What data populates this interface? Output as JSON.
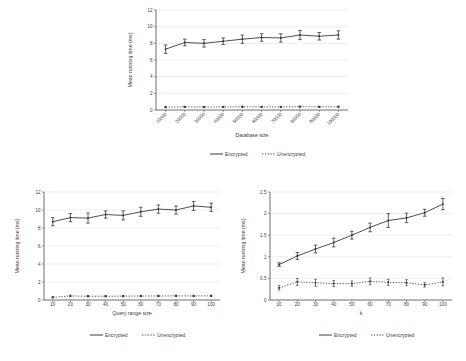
{
  "figure": {
    "title": "",
    "panels": [
      "database-size-panel",
      "query-range-panel",
      "k-panel"
    ]
  },
  "legend": {
    "encrypted_label": "Encrypted",
    "unencrypted_label": "Unencrypted"
  },
  "colors": {
    "encrypted": "#3a3a3a",
    "unencrypted": "#555555",
    "grid": "#e3e3e3",
    "axis": "#4a4a4a",
    "background": "#ffffff"
  },
  "chart_data": [
    {
      "id": "database-size",
      "type": "line",
      "title": "",
      "xlabel": "Database size",
      "ylabel": "Mean running time (ms)",
      "categories": [
        "10000",
        "20000",
        "30000",
        "40000",
        "50000",
        "60000",
        "70000",
        "80000",
        "90000",
        "100000"
      ],
      "yticks": [
        0,
        2,
        4,
        6,
        8,
        10,
        12
      ],
      "ylim": [
        0,
        12
      ],
      "grid": true,
      "legend_position": "bottom",
      "series": [
        {
          "name": "Encrypted",
          "style": "solid",
          "values": [
            7.3,
            8.1,
            8.0,
            8.25,
            8.5,
            8.7,
            8.65,
            9.0,
            8.85,
            9.0
          ],
          "errors": [
            0.5,
            0.4,
            0.45,
            0.4,
            0.5,
            0.45,
            0.5,
            0.55,
            0.45,
            0.5
          ]
        },
        {
          "name": "Unencrypted",
          "style": "dotted",
          "values": [
            0.35,
            0.38,
            0.36,
            0.37,
            0.39,
            0.38,
            0.37,
            0.4,
            0.38,
            0.39
          ],
          "errors": [
            0.08,
            0.07,
            0.07,
            0.07,
            0.08,
            0.07,
            0.07,
            0.08,
            0.07,
            0.08
          ]
        }
      ]
    },
    {
      "id": "query-range-size",
      "type": "line",
      "title": "",
      "xlabel": "Query range size",
      "ylabel": "Mean running time (ms)",
      "categories": [
        "10",
        "20",
        "30",
        "40",
        "50",
        "60",
        "70",
        "80",
        "90",
        "100"
      ],
      "yticks": [
        0,
        2,
        4,
        6,
        8,
        10,
        12
      ],
      "ylim": [
        0,
        12
      ],
      "grid": true,
      "legend_position": "bottom",
      "series": [
        {
          "name": "Encrypted",
          "style": "solid",
          "values": [
            8.7,
            9.15,
            9.1,
            9.5,
            9.4,
            9.8,
            10.1,
            10.0,
            10.45,
            10.3
          ],
          "errors": [
            0.45,
            0.45,
            0.55,
            0.4,
            0.5,
            0.5,
            0.45,
            0.45,
            0.5,
            0.45
          ]
        },
        {
          "name": "Unencrypted",
          "style": "dotted",
          "values": [
            0.3,
            0.45,
            0.42,
            0.42,
            0.43,
            0.44,
            0.45,
            0.46,
            0.45,
            0.46
          ],
          "errors": [
            0.08,
            0.08,
            0.08,
            0.08,
            0.08,
            0.08,
            0.08,
            0.08,
            0.08,
            0.08
          ]
        }
      ]
    },
    {
      "id": "k",
      "type": "line",
      "title": "",
      "xlabel": "k",
      "ylabel": "Mean running time (ms)",
      "categories": [
        "10",
        "20",
        "30",
        "40",
        "50",
        "60",
        "70",
        "80",
        "90",
        "100"
      ],
      "yticks": [
        0,
        0.5,
        1,
        1.5,
        2,
        2.5
      ],
      "yticklabels": [
        "0",
        "0.5",
        "1",
        "1.5",
        "2",
        "2.5"
      ],
      "ylim": [
        0,
        2.5
      ],
      "grid": true,
      "legend_position": "bottom",
      "series": [
        {
          "name": "Encrypted",
          "style": "solid",
          "values": [
            0.82,
            1.02,
            1.18,
            1.33,
            1.5,
            1.68,
            1.84,
            1.9,
            2.02,
            2.22
          ],
          "errors": [
            0.04,
            0.08,
            0.09,
            0.1,
            0.09,
            0.1,
            0.16,
            0.11,
            0.08,
            0.13
          ]
        },
        {
          "name": "Unencrypted",
          "style": "dotted",
          "values": [
            0.28,
            0.42,
            0.4,
            0.38,
            0.38,
            0.43,
            0.41,
            0.4,
            0.35,
            0.42
          ],
          "errors": [
            0.05,
            0.08,
            0.08,
            0.07,
            0.06,
            0.08,
            0.07,
            0.07,
            0.05,
            0.09
          ]
        }
      ]
    }
  ]
}
